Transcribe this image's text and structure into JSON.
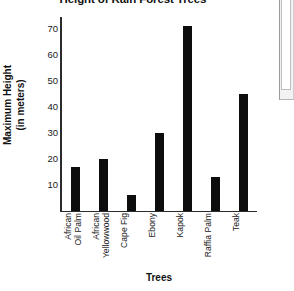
{
  "chart_data": {
    "type": "bar",
    "title": "Height of Rain Forest Trees",
    "xlabel": "Trees",
    "ylabel": "Maximum Height (in meters)",
    "ylabel_line1": "Maximum Height",
    "ylabel_line2": "(in meters)",
    "categories": [
      "African Oil Palm",
      "African Yellowwood",
      "Cape Fig",
      "Ebony",
      "Kapok",
      "Raffia Palm",
      "Teak"
    ],
    "category_lines": [
      [
        "African",
        "Oil Palm"
      ],
      [
        "African",
        "Yellowwood"
      ],
      [
        "Cape Fig"
      ],
      [
        "Ebony"
      ],
      [
        "Kapok"
      ],
      [
        "Raffia Palm"
      ],
      [
        "Teak"
      ]
    ],
    "values": [
      17,
      20,
      6,
      30,
      71,
      13,
      45
    ],
    "ylim": [
      0,
      75
    ],
    "yticks": [
      10,
      20,
      30,
      40,
      50,
      60,
      70
    ],
    "ytick_labels": [
      "10",
      "20",
      "30",
      "40",
      "50",
      "60",
      "70"
    ],
    "grid": false,
    "legend": null,
    "bar_color": "#0d0d0d",
    "axis_color": "#2b2b2b",
    "background": "#ffffff"
  },
  "scrollbar": {
    "name": "vertical-scrollbar",
    "track_color": "#f2f2f2",
    "thumb_color": "#ffffff"
  }
}
